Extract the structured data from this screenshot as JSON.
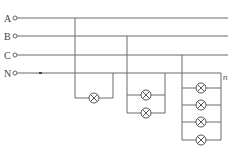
{
  "diagram": {
    "title": "",
    "phases": [
      {
        "label": "A",
        "y": 18
      },
      {
        "label": "B",
        "y": 36
      },
      {
        "label": "C",
        "y": 55
      },
      {
        "label": "N",
        "y": 73
      }
    ],
    "groups": [
      {
        "name": "group-1",
        "phase": "A",
        "lamps": 1
      },
      {
        "name": "group-2",
        "phase": "B",
        "lamps": 2
      },
      {
        "name": "group-3",
        "phase": "C",
        "lamps": 4
      }
    ],
    "n_label": "n",
    "lamp_symbol": "lamp-icon"
  }
}
